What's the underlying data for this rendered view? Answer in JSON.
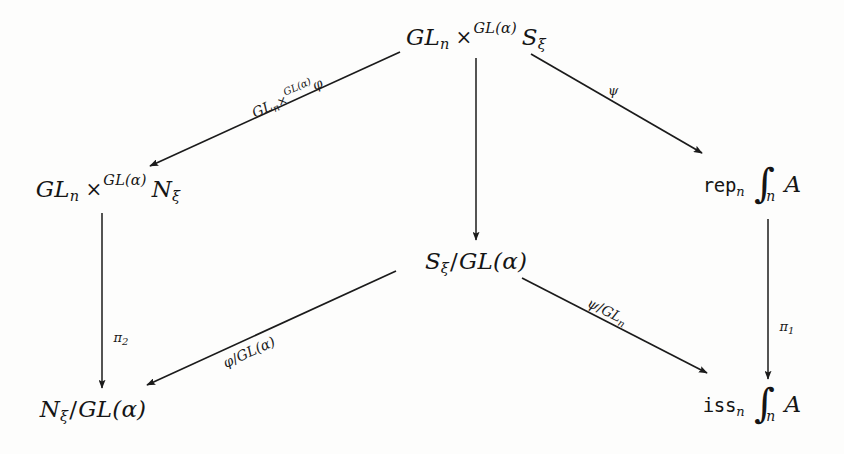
{
  "diagram": {
    "background_color": "#fdfdfc",
    "ink_color": "#1b1b1b",
    "nodes": [
      {
        "id": "top",
        "label": "GL_n ×^{GL(α)} S_ξ",
        "base1": "GL",
        "sub1": "n",
        "times": "×",
        "sup": "GL(α)",
        "base2": "S",
        "sub2": "ξ",
        "x": 476,
        "y": 36
      },
      {
        "id": "left-mid",
        "label": "GL_n ×^{GL(α)} N_ξ",
        "base1": "GL",
        "sub1": "n",
        "times": "×",
        "sup": "GL(α)",
        "base2": "N",
        "sub2": "ξ",
        "x": 108,
        "y": 188
      },
      {
        "id": "center",
        "label": "S_ξ/GL(α)",
        "base1": "S",
        "sub1": "ξ",
        "slash": "/",
        "base2": "GL(α)",
        "x": 476,
        "y": 262
      },
      {
        "id": "right-top",
        "label": "rep_n ∫_n A",
        "mono": "rep",
        "sub1": "n",
        "integral": "∫",
        "intsub": "n",
        "operand": "A",
        "x": 752,
        "y": 185
      },
      {
        "id": "bottom-left",
        "label": "N_ξ/GL(α)",
        "base1": "N",
        "sub1": "ξ",
        "slash": "/",
        "base2": "GL(α)",
        "x": 93,
        "y": 410
      },
      {
        "id": "bottom-right",
        "label": "iss_n ∫_n A",
        "mono": "iss",
        "sub1": "n",
        "integral": "∫",
        "intsub": "n",
        "operand": "A",
        "x": 752,
        "y": 405
      }
    ],
    "arrows": [
      {
        "id": "top-to-leftmid",
        "from": "top",
        "to": "left-mid",
        "x1": 400,
        "y1": 52,
        "x2": 150,
        "y2": 166,
        "label": "GL_n ×^{GL(α)} φ"
      },
      {
        "id": "top-to-center",
        "from": "top",
        "to": "center",
        "x1": 476,
        "y1": 58,
        "x2": 476,
        "y2": 240,
        "label": ""
      },
      {
        "id": "top-to-righttop",
        "from": "top",
        "to": "right-top",
        "x1": 531,
        "y1": 54,
        "x2": 702,
        "y2": 153,
        "label": "ψ"
      },
      {
        "id": "leftmid-to-bottomleft",
        "from": "left-mid",
        "to": "bottom-left",
        "x1": 102,
        "y1": 213,
        "x2": 102,
        "y2": 388,
        "label": "π₂"
      },
      {
        "id": "center-to-bottomleft",
        "from": "center",
        "to": "bottom-left",
        "x1": 396,
        "y1": 271,
        "x2": 147,
        "y2": 385,
        "label": "φ/GL(α)"
      },
      {
        "id": "center-to-bottomright",
        "from": "center",
        "to": "bottom-right",
        "x1": 522,
        "y1": 278,
        "x2": 707,
        "y2": 373,
        "label": "ψ/GL_n"
      },
      {
        "id": "righttop-to-bottomright",
        "from": "right-top",
        "to": "bottom-right",
        "x1": 768,
        "y1": 219,
        "x2": 768,
        "y2": 379,
        "label": "π₁"
      }
    ],
    "labels": {
      "gl_phi": {
        "base1": "GL",
        "sub1": "n",
        "times": "×",
        "sup": "GL(α)",
        "map": "φ",
        "x": 287,
        "y": 97,
        "rotate": -24.5
      },
      "psi": {
        "text": "ψ",
        "x": 613,
        "y": 90,
        "rotate": 0
      },
      "pi2": {
        "text": "π",
        "sub": "2",
        "x": 121,
        "y": 338,
        "rotate": 0
      },
      "phi_gl": {
        "map": "φ",
        "slash": "/",
        "base": "GL(α)",
        "x": 249,
        "y": 352,
        "rotate": -24.5
      },
      "psi_gln": {
        "map": "ψ",
        "slash": "/",
        "base": "GL",
        "sub": "n",
        "x": 607,
        "y": 312,
        "rotate": 27
      },
      "pi1": {
        "text": "π",
        "sub": "1",
        "x": 787,
        "y": 327,
        "rotate": 0
      }
    }
  }
}
